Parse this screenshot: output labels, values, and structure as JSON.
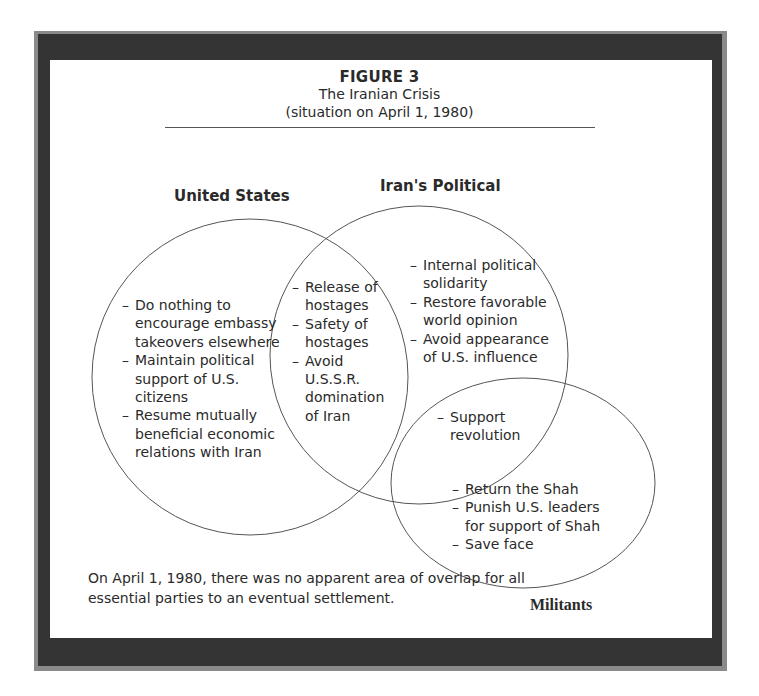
{
  "figure": {
    "number": "FIGURE 3",
    "title": "The Iranian Crisis",
    "subtitle": "(situation on April 1, 1980)"
  },
  "parties": {
    "united_states": {
      "label": "United States",
      "items": [
        "Do nothing to encourage embassy takeovers elsewhere",
        "Maintain political support of U.S. citizens",
        "Resume mutually beneficial economic relations with Iran"
      ]
    },
    "iran_political": {
      "label": "Iran's Political",
      "items": [
        "Internal political solidarity",
        "Restore favorable world opinion",
        "Avoid appearance of U.S. influence"
      ]
    },
    "militants": {
      "label": "Militants",
      "items": [
        "Return the Shah",
        "Punish U.S. leaders for support of Shah",
        "Save face"
      ]
    }
  },
  "overlaps": {
    "us_iran": {
      "items": [
        "Release of hostages",
        "Safety of hostages",
        "Avoid U.S.S.R. domination of Iran"
      ]
    },
    "iran_militants": {
      "items": [
        "Support revolution"
      ]
    }
  },
  "note": "On April 1, 1980, there was no apparent area of overlap for all essential parties to an eventual settlement.",
  "colors": {
    "frame_dark": "#343434",
    "frame_edge": "#8a8a8a",
    "line": "#555555",
    "text": "#2a2a2a"
  }
}
